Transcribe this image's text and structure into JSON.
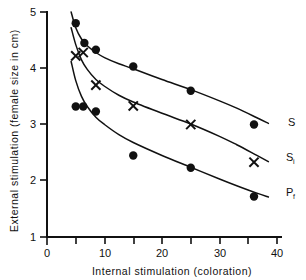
{
  "chart_data": {
    "type": "scatter",
    "title": "",
    "xlabel": "Internal   stimulation   (coloration)",
    "ylabel": "External  stimulation   (female size in cm)",
    "xlim": [
      0,
      45
    ],
    "ylim": [
      1,
      5
    ],
    "grid": false,
    "legend_position": "right-inline",
    "xticks": [
      0,
      5,
      10,
      15,
      20,
      25,
      30,
      35,
      40
    ],
    "xticklabels": [
      "0",
      "",
      "10",
      "",
      "20",
      "",
      "30",
      "",
      "40"
    ],
    "yticks": [
      1,
      2,
      3,
      4,
      5
    ],
    "yticklabels": [
      "1",
      "2",
      "3",
      "4",
      "5"
    ],
    "series": [
      {
        "name": "S",
        "label": "S",
        "sublabel": "",
        "marker": "filled-circle",
        "x": [
          5.0,
          6.5,
          8.5,
          15.0,
          25.0,
          36.0
        ],
        "y": [
          4.8,
          4.45,
          4.33,
          4.03,
          3.6,
          3.0
        ],
        "fit_curve": [
          [
            4.2,
            5.0
          ],
          [
            5.0,
            4.72
          ],
          [
            6.0,
            4.52
          ],
          [
            7.0,
            4.4
          ],
          [
            8.5,
            4.28
          ],
          [
            10.0,
            4.19
          ],
          [
            12.5,
            4.08
          ],
          [
            15.0,
            3.99
          ],
          [
            20.0,
            3.8
          ],
          [
            25.0,
            3.62
          ],
          [
            30.0,
            3.42
          ],
          [
            33.0,
            3.29
          ],
          [
            36.5,
            3.12
          ],
          [
            38.5,
            3.02
          ]
        ]
      },
      {
        "name": "Si",
        "label": "S",
        "sublabel": "i",
        "marker": "x-cross",
        "x": [
          5.0,
          6.3,
          8.5,
          15.0,
          25.0,
          36.0
        ],
        "y": [
          4.22,
          4.28,
          3.7,
          3.33,
          3.0,
          2.33
        ],
        "fit_curve": [
          [
            4.2,
            4.72
          ],
          [
            5.0,
            4.42
          ],
          [
            6.0,
            4.15
          ],
          [
            7.0,
            3.98
          ],
          [
            8.5,
            3.8
          ],
          [
            10.0,
            3.68
          ],
          [
            12.5,
            3.52
          ],
          [
            15.0,
            3.4
          ],
          [
            20.0,
            3.2
          ],
          [
            25.0,
            3.01
          ],
          [
            30.0,
            2.79
          ],
          [
            33.0,
            2.64
          ],
          [
            36.5,
            2.45
          ],
          [
            38.5,
            2.34
          ]
        ]
      },
      {
        "name": "Pf",
        "label": "P",
        "sublabel": "f",
        "marker": "filled-circle",
        "x": [
          5.0,
          6.3,
          8.5,
          15.0,
          25.0,
          36.0
        ],
        "y": [
          3.32,
          3.32,
          3.23,
          2.45,
          2.23,
          1.72
        ],
        "fit_curve": [
          [
            4.2,
            4.12
          ],
          [
            5.0,
            3.78
          ],
          [
            6.0,
            3.5
          ],
          [
            7.0,
            3.32
          ],
          [
            8.5,
            3.13
          ],
          [
            10.0,
            3.0
          ],
          [
            12.5,
            2.82
          ],
          [
            15.0,
            2.68
          ],
          [
            20.0,
            2.45
          ],
          [
            25.0,
            2.24
          ],
          [
            30.0,
            2.03
          ],
          [
            33.0,
            1.91
          ],
          [
            36.5,
            1.78
          ],
          [
            38.5,
            1.71
          ]
        ]
      }
    ]
  }
}
